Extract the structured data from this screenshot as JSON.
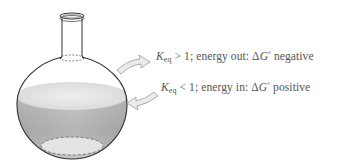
{
  "figure": {
    "labels": {
      "top": {
        "k": "K",
        "k_sub": "eq",
        "relation": " > 1; energy out: Δ",
        "g": "G",
        "g_sup": "°",
        "tail": " negative"
      },
      "bottom": {
        "k": "K",
        "k_sub": "eq",
        "relation": " < 1; energy in: Δ",
        "g": "G",
        "g_sup": "°",
        "tail": " positive"
      }
    },
    "arrows": [
      {
        "name": "energy-out-arrow",
        "direction": "out"
      },
      {
        "name": "energy-in-arrow",
        "direction": "in"
      }
    ],
    "colors": {
      "outline": "#333333",
      "liquid_surface": "#e6e6e6",
      "liquid_body": "#a8a8a8",
      "arrow_fill": "#e9ece7",
      "arrow_stroke": "#9a9a9a",
      "text": "#555555"
    }
  }
}
